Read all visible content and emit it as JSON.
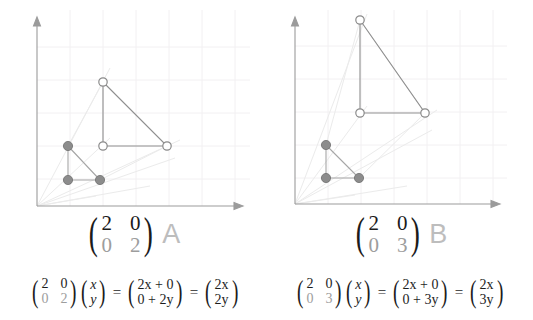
{
  "canvas": {
    "width": 533,
    "height": 320,
    "background": "#ffffff"
  },
  "colors": {
    "axis": "#9b9b9b",
    "grid": "#f2f0f2",
    "ray": "#ededed",
    "shape_original_fill": "#8c8c8c",
    "shape_original_stroke": "#9e9e9e",
    "shape_transformed_stroke": "#8f8f8f",
    "shape_transformed_fill": "#ffffff",
    "matrix_text": "#1b1b1b",
    "matrix_dim_text": "#9d9d9d",
    "letter_label": "#bdbdbd"
  },
  "panels": [
    {
      "id": "panel-left",
      "name": "transformation-A",
      "letter": "A",
      "matrix": {
        "a": "2",
        "b": "0",
        "c": "0",
        "d": "2",
        "dim_cells": [
          "c",
          "d"
        ]
      },
      "axes": {
        "x_axis": {
          "x1": 37,
          "y1": 206,
          "x2": 238,
          "y2": 206
        },
        "y_axis": {
          "x1": 37,
          "y1": 206,
          "x2": 37,
          "y2": 22
        },
        "origin": {
          "x": 37,
          "y": 206
        },
        "grid_spacing": 33,
        "grid_visible": true
      },
      "original_points": [
        {
          "label": "P1",
          "x": 68,
          "y": 146
        },
        {
          "label": "P2",
          "x": 68,
          "y": 180
        },
        {
          "label": "P3",
          "x": 100,
          "y": 180
        }
      ],
      "transformed_points": [
        {
          "label": "P1'",
          "x": 103,
          "y": 82
        },
        {
          "label": "P2'",
          "x": 103,
          "y": 146
        },
        {
          "label": "P3'",
          "x": 167,
          "y": 146
        }
      ],
      "equation": {
        "matrix": {
          "a": "2",
          "b": "0",
          "c": "0",
          "d": "2",
          "dim_cells": [
            "c",
            "d"
          ]
        },
        "vector": {
          "top": "x",
          "bottom": "y"
        },
        "result1": {
          "top": "2x + 0",
          "bottom": "0 + 2y"
        },
        "result2": {
          "top": "2x",
          "bottom": "2y"
        },
        "equals": "="
      }
    },
    {
      "id": "panel-right",
      "name": "transformation-B",
      "letter": "B",
      "matrix": {
        "a": "2",
        "b": "0",
        "c": "0",
        "d": "3",
        "dim_cells": [
          "c",
          "d"
        ]
      },
      "axes": {
        "x_axis": {
          "x1": 28,
          "y1": 204,
          "x2": 228,
          "y2": 204
        },
        "y_axis": {
          "x1": 28,
          "y1": 204,
          "x2": 28,
          "y2": 22
        },
        "origin": {
          "x": 28,
          "y": 204
        },
        "grid_spacing": 33,
        "grid_visible": true
      },
      "original_points": [
        {
          "label": "P1",
          "x": 59,
          "y": 145
        },
        {
          "label": "P2",
          "x": 59,
          "y": 178
        },
        {
          "label": "P3",
          "x": 92,
          "y": 178
        }
      ],
      "transformed_points": [
        {
          "label": "P1'",
          "x": 93,
          "y": 20
        },
        {
          "label": "P2'",
          "x": 93,
          "y": 113
        },
        {
          "label": "P3'",
          "x": 158,
          "y": 113
        }
      ],
      "equation": {
        "matrix": {
          "a": "2",
          "b": "0",
          "c": "0",
          "d": "3",
          "dim_cells": [
            "c",
            "d"
          ]
        },
        "vector": {
          "top": "x",
          "bottom": "y"
        },
        "result1": {
          "top": "2x + 0",
          "bottom": "0 + 3y"
        },
        "result2": {
          "top": "2x",
          "bottom": "3y"
        },
        "equals": "="
      }
    }
  ]
}
